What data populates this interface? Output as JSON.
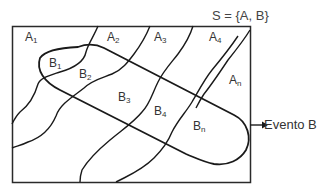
{
  "diagram": {
    "title": "S = {A, B}",
    "event_label": "Evento B",
    "partitions": [
      {
        "base": "A",
        "sub": "1"
      },
      {
        "base": "A",
        "sub": "2"
      },
      {
        "base": "A",
        "sub": "3"
      },
      {
        "base": "A",
        "sub": "4"
      },
      {
        "base": "A",
        "sub": "n"
      }
    ],
    "intersections": [
      {
        "base": "B",
        "sub": "1"
      },
      {
        "base": "B",
        "sub": "2"
      },
      {
        "base": "B",
        "sub": "3"
      },
      {
        "base": "B",
        "sub": "4"
      },
      {
        "base": "B",
        "sub": "n"
      }
    ],
    "colors": {
      "stroke": "#1a1a1a",
      "text": "#333333",
      "background": "#ffffff"
    }
  }
}
